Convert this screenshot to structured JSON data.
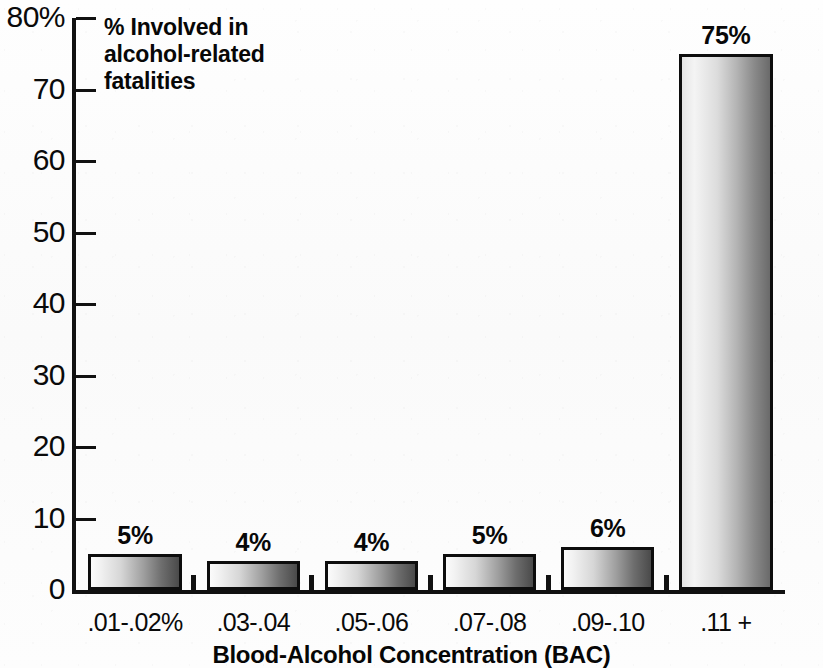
{
  "chart_data": {
    "type": "bar",
    "title": "",
    "annotation": "% Involved in\nalcohol-related\nfatalities",
    "xlabel": "Blood-Alcohol Concentration (BAC)",
    "ylabel": "",
    "ylim": [
      0,
      80
    ],
    "grid": false,
    "legend": "none",
    "categories": [
      ".01-.02%",
      ".03-.04",
      ".05-.06",
      ".07-.08",
      ".09-.10",
      ".11 +"
    ],
    "values": [
      5,
      4,
      4,
      5,
      6,
      75
    ],
    "value_labels": [
      "5%",
      "4%",
      "4%",
      "5%",
      "6%",
      "75%"
    ],
    "y_ticks": [
      0,
      10,
      20,
      30,
      40,
      50,
      60,
      70,
      80
    ],
    "y_tick_labels": [
      "0",
      "10",
      "20",
      "30",
      "40",
      "50",
      "60",
      "70",
      "80%"
    ],
    "series": [
      {
        "name": "% Involved in alcohol-related fatalities",
        "values": [
          5,
          4,
          4,
          5,
          6,
          75
        ]
      }
    ],
    "colors": {
      "bar_fill_light": "#fbfbfb",
      "bar_fill_dark": "#4a4a4a",
      "bar_outline": "#0d0d0d",
      "axis": "#111111",
      "text": "#000000",
      "background": "#fdfdfd"
    }
  }
}
